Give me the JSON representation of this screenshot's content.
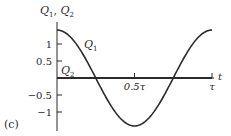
{
  "panel_label": "(c)",
  "chart_data": {
    "type": "line",
    "title": "",
    "xlabel": "t",
    "ylabel": "Q1, Q2",
    "ylabel_parts": {
      "q": "Q",
      "sub1": "1",
      "sep": ", ",
      "sub2": "2"
    },
    "x_ticks": [
      {
        "value": 0.5,
        "label": "0.5τ"
      },
      {
        "value": 1.0,
        "label": "τ"
      }
    ],
    "y_ticks": [
      {
        "value": 1,
        "label": "1"
      },
      {
        "value": 0.5,
        "label": "0.5"
      },
      {
        "value": -0.5,
        "label": "−0.5"
      },
      {
        "value": -1,
        "label": "−1"
      }
    ],
    "xlim": [
      0,
      1
    ],
    "ylim": [
      -1.45,
      1.45
    ],
    "grid": false,
    "series": [
      {
        "name": "Q1",
        "label_q": "Q",
        "label_sub": "1",
        "formula": "sqrt(2)*cos(2*pi*t/tau)",
        "x": [
          0,
          0.125,
          0.25,
          0.375,
          0.5,
          0.625,
          0.75,
          0.875,
          1.0
        ],
        "values": [
          1.41,
          1.0,
          0.0,
          -1.0,
          -1.41,
          -1.0,
          0.0,
          1.0,
          1.41
        ]
      },
      {
        "name": "Q2",
        "label_q": "Q",
        "label_sub": "2",
        "formula": "0",
        "x": [
          0,
          1.0
        ],
        "values": [
          0,
          0
        ]
      }
    ]
  }
}
